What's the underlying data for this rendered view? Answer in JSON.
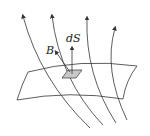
{
  "diagram": {
    "type": "magnetic-flux-through-surface",
    "labels": {
      "area_element": "dS",
      "field": "B"
    },
    "colors": {
      "stroke": "#333333",
      "patch_fill": "#c8c8c8",
      "background": "#ffffff"
    },
    "field_line_count": 4
  }
}
